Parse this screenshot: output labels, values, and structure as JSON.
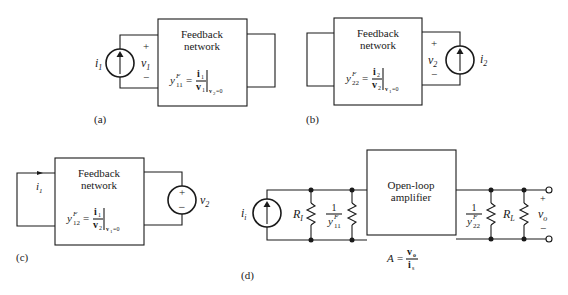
{
  "figure": {
    "panels": [
      {
        "id": "a",
        "label": "(a)",
        "box_title_line1": "Feedback",
        "box_title_line2": "network",
        "param_symbol": "y",
        "param_super": "F",
        "param_sub": "11",
        "eq": "=",
        "numerator": "i",
        "numerator_sub": "1",
        "denominator": "v",
        "denominator_sub": "1",
        "condition": "v",
        "condition_sub": "2",
        "condition_val": "=0",
        "source_type": "current-source",
        "source_label": "i",
        "source_label_sub": "1",
        "port_plus": "+",
        "port_minus": "−",
        "port_voltage": "v",
        "port_voltage_sub": "1"
      },
      {
        "id": "b",
        "label": "(b)",
        "box_title_line1": "Feedback",
        "box_title_line2": "network",
        "param_symbol": "y",
        "param_super": "F",
        "param_sub": "22",
        "eq": "=",
        "numerator": "i",
        "numerator_sub": "2",
        "denominator": "v",
        "denominator_sub": "2",
        "condition": "v",
        "condition_sub": "1",
        "condition_val": "=0",
        "source_type": "current-source",
        "source_label": "i",
        "source_label_sub": "2",
        "port_plus": "+",
        "port_minus": "−",
        "port_voltage": "v",
        "port_voltage_sub": "2"
      },
      {
        "id": "c",
        "label": "(c)",
        "box_title_line1": "Feedback",
        "box_title_line2": "network",
        "param_symbol": "y",
        "param_super": "F",
        "param_sub": "12",
        "eq": "=",
        "numerator": "i",
        "numerator_sub": "1",
        "denominator": "v",
        "denominator_sub": "2",
        "condition": "v",
        "condition_sub": "1",
        "condition_val": "=0",
        "source_type": "voltage-source",
        "source_label": "v",
        "source_label_sub": "2",
        "source_plus": "+",
        "source_minus": "−",
        "current_label": "i",
        "current_label_sub": "1"
      },
      {
        "id": "d",
        "label": "(d)",
        "box_title_line1": "Open-loop",
        "box_title_line2": "amplifier",
        "source_label": "i",
        "source_label_sub": "i",
        "r_in_label": "R",
        "r_in_sub": "I",
        "y11_num": "1",
        "y11_den": "y",
        "y11_super": "F",
        "y11_sub": "11",
        "y22_num": "1",
        "y22_den": "y",
        "y22_super": "F",
        "y22_sub": "22",
        "r_load_label": "R",
        "r_load_sub": "L",
        "out_plus": "+",
        "out_minus": "−",
        "out_voltage": "v",
        "out_voltage_sub": "o",
        "gain_lhs": "A =",
        "gain_num": "v",
        "gain_num_sub": "o",
        "gain_den": "i",
        "gain_den_sub": "s"
      }
    ]
  }
}
